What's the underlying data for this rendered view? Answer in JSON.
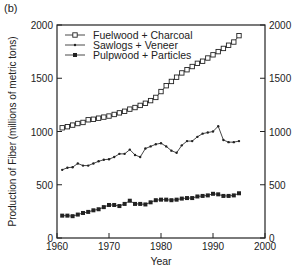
{
  "panel_label": "(b)",
  "chart_data": {
    "type": "line",
    "title": "",
    "xlabel": "Year",
    "ylabel": "Production of Fiber (millions of metric tons)",
    "xlim": [
      1960,
      2000
    ],
    "ylim": [
      0,
      2000
    ],
    "xticks": [
      1960,
      1970,
      1980,
      1990,
      2000
    ],
    "yticks": [
      0,
      500,
      1000,
      1500,
      2000
    ],
    "right_yticks": [
      0,
      500,
      1000,
      1500,
      2000
    ],
    "grid": false,
    "legend_position": "upper left",
    "x": [
      1961,
      1962,
      1963,
      1964,
      1965,
      1966,
      1967,
      1968,
      1969,
      1970,
      1971,
      1972,
      1973,
      1974,
      1975,
      1976,
      1977,
      1978,
      1979,
      1980,
      1981,
      1982,
      1983,
      1984,
      1985,
      1986,
      1987,
      1988,
      1989,
      1990,
      1991,
      1992,
      1993,
      1994,
      1995
    ],
    "series": [
      {
        "name": "Fuelwood + Charcoal",
        "marker": "open-square",
        "values": [
          1035,
          1045,
          1060,
          1075,
          1085,
          1110,
          1115,
          1125,
          1135,
          1145,
          1160,
          1175,
          1190,
          1210,
          1225,
          1245,
          1265,
          1290,
          1320,
          1375,
          1430,
          1470,
          1510,
          1550,
          1580,
          1610,
          1640,
          1660,
          1690,
          1720,
          1750,
          1780,
          1810,
          1840,
          1900
        ]
      },
      {
        "name": "Sawlogs + Veneer",
        "marker": "small-x",
        "values": [
          640,
          660,
          665,
          700,
          680,
          680,
          700,
          720,
          735,
          740,
          760,
          790,
          790,
          830,
          780,
          760,
          840,
          860,
          880,
          890,
          860,
          820,
          800,
          870,
          910,
          910,
          950,
          980,
          990,
          1000,
          1050,
          920,
          900,
          900,
          910
        ]
      },
      {
        "name": "Pulpwood + Particles",
        "marker": "filled-square",
        "values": [
          210,
          210,
          205,
          220,
          235,
          245,
          260,
          270,
          290,
          310,
          310,
          300,
          320,
          350,
          320,
          320,
          315,
          335,
          355,
          360,
          360,
          355,
          360,
          370,
          375,
          375,
          390,
          395,
          400,
          415,
          410,
          395,
          395,
          400,
          420
        ]
      }
    ]
  }
}
